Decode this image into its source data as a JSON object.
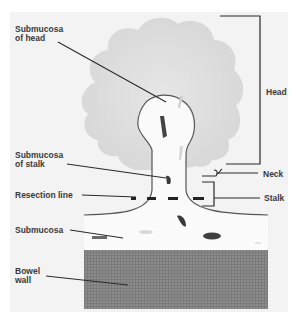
{
  "diagram": {
    "colors": {
      "background": "#f4f4f4",
      "polyp_head": "#dcdcdc",
      "submucosa": "#f8f8f8",
      "outline": "#555555",
      "bowel_wall": "#8a8a8a",
      "leader_line": "#2a2a2a",
      "label_text": "#3a3a3a"
    },
    "labels": {
      "submucosa_of_head": "Submucosa\nof head",
      "head": "Head",
      "submucosa_of_stalk": "Submucosa\nof stalk",
      "neck": "Neck",
      "resection_line": "Resection line",
      "stalk": "Stalk",
      "submucosa": "Submucosa",
      "bowel_wall": "Bowel\nwall"
    }
  }
}
